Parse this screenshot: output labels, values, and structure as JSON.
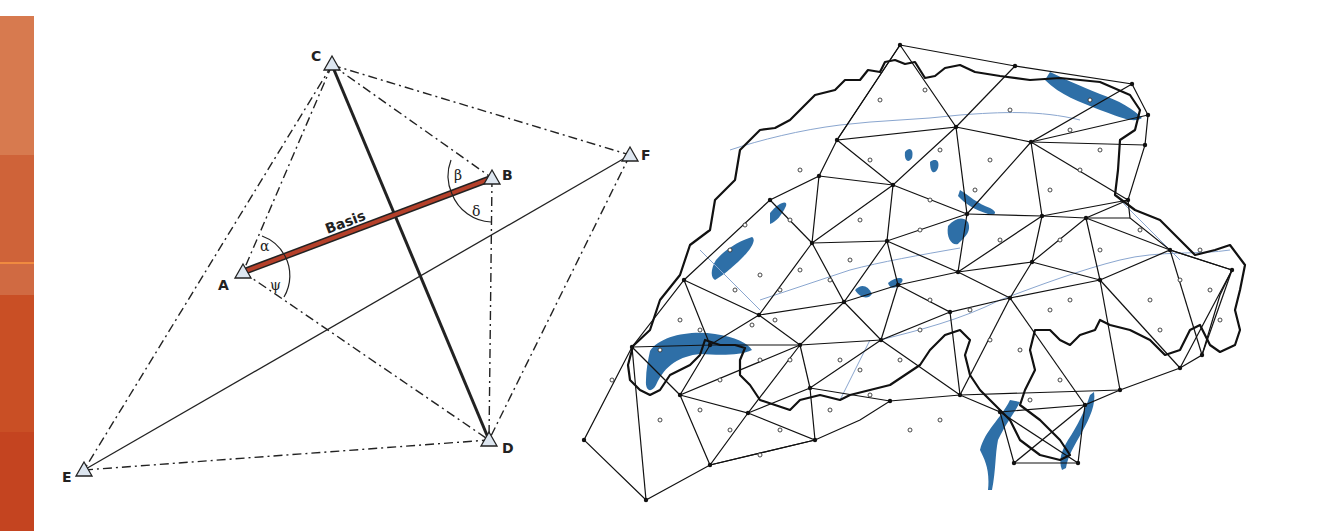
{
  "side_strip": {
    "bands": [
      {
        "top": 0,
        "height": 139,
        "color": "#d77a4f"
      },
      {
        "top": 139,
        "height": 107,
        "color": "#cf6339"
      },
      {
        "top": 246,
        "height": 2,
        "color": "#f08a40"
      },
      {
        "top": 248,
        "height": 31,
        "color": "#d06a42"
      },
      {
        "top": 279,
        "height": 137,
        "color": "#c94f25"
      },
      {
        "top": 416,
        "height": 99,
        "color": "#c44420"
      }
    ]
  },
  "triangulation_diagram": {
    "baseline_label": "Basis",
    "baseline_color": "#b5402a",
    "stations": [
      {
        "name": "A",
        "x": 243,
        "y": 272
      },
      {
        "name": "B",
        "x": 492,
        "y": 178
      },
      {
        "name": "C",
        "x": 332,
        "y": 65
      },
      {
        "name": "D",
        "x": 489,
        "y": 440
      },
      {
        "name": "E",
        "x": 84,
        "y": 470
      },
      {
        "name": "F",
        "x": 630,
        "y": 155
      }
    ],
    "angles": [
      {
        "symbol": "α",
        "x": 263,
        "y": 247
      },
      {
        "symbol": "ψ",
        "x": 273,
        "y": 287
      },
      {
        "symbol": "β",
        "x": 457,
        "y": 177
      },
      {
        "symbol": "δ",
        "x": 475,
        "y": 212
      }
    ]
  },
  "network_map": {
    "title": "Swiss triangulation network",
    "lake_color": "#2e6fa7",
    "river_color": "#8aa6cf",
    "border_color": "#111111"
  }
}
